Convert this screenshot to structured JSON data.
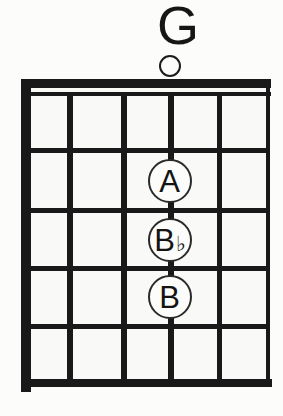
{
  "chord": {
    "name": "G",
    "strings_count": 6,
    "frets_count": 5,
    "open_string_marker": {
      "shape": "open-circle",
      "string": 4
    },
    "notes": [
      {
        "label": "A",
        "accidental": "",
        "string": 4,
        "fret": 2
      },
      {
        "label": "B",
        "accidental": "♭",
        "string": 4,
        "fret": 3
      },
      {
        "label": "B",
        "accidental": "",
        "string": 4,
        "fret": 4
      }
    ]
  },
  "colors": {
    "ink": "#191919",
    "paper": "#fcfcfb"
  }
}
